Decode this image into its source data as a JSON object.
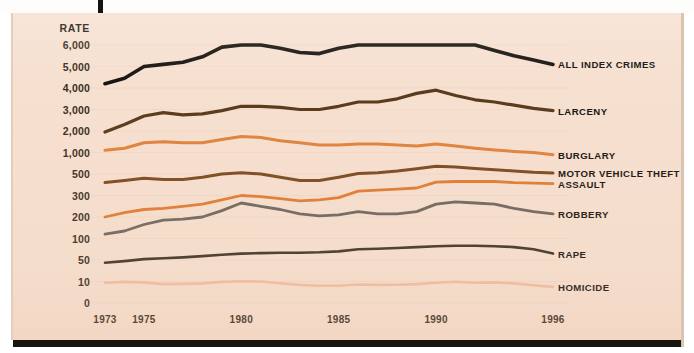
{
  "figure": {
    "background_color": "#f6e0d0",
    "rate_axis_title": "RATE",
    "y_tick_labels": [
      "6,000",
      "5,000",
      "4,000",
      "3,000",
      "2,000",
      "1,000",
      "500",
      "300",
      "200",
      "100",
      "50",
      "10",
      "0"
    ],
    "x_tick_labels": [
      "1973",
      "1975",
      "1980",
      "1985",
      "1990",
      "1996"
    ]
  },
  "chart_data": {
    "type": "line",
    "title": "",
    "subtitle": "",
    "xlabel": "",
    "ylabel": "RATE",
    "grid": true,
    "legend_position": "right-inline",
    "y_scale": "piecewise-log",
    "y_tick_values": [
      6000,
      5000,
      4000,
      3000,
      2000,
      1000,
      500,
      300,
      200,
      100,
      50,
      10,
      0
    ],
    "xlim": [
      1973,
      1996
    ],
    "x": [
      1973,
      1974,
      1975,
      1976,
      1977,
      1978,
      1979,
      1980,
      1981,
      1982,
      1983,
      1984,
      1985,
      1986,
      1987,
      1988,
      1989,
      1990,
      1991,
      1992,
      1993,
      1994,
      1995,
      1996
    ],
    "series": [
      {
        "name": "ALL INDEX CRIMES",
        "color": "#191410",
        "values": [
          4200,
          4450,
          5000,
          5100,
          5200,
          5450,
          5900,
          6250,
          6150,
          5850,
          5650,
          5600,
          5850,
          6050,
          6000,
          6200,
          6350,
          6400,
          6200,
          6000,
          5750,
          5500,
          5300,
          5100
        ]
      },
      {
        "name": "LARCENY",
        "color": "#5a3a1c",
        "values": [
          1950,
          2300,
          2700,
          2850,
          2750,
          2800,
          2950,
          3150,
          3150,
          3100,
          3000,
          3000,
          3150,
          3350,
          3350,
          3500,
          3750,
          3900,
          3650,
          3450,
          3350,
          3200,
          3050,
          2950
        ]
      },
      {
        "name": "BURGLARY",
        "color": "#e0823c",
        "values": [
          1100,
          1200,
          1450,
          1500,
          1450,
          1450,
          1600,
          1750,
          1700,
          1550,
          1450,
          1350,
          1350,
          1400,
          1400,
          1350,
          1300,
          1400,
          1300,
          1200,
          1120,
          1050,
          1000,
          950
        ]
      },
      {
        "name": "MOTOR VEHICLE THEFT",
        "color": "#7a4a1e",
        "values": [
          420,
          440,
          460,
          450,
          450,
          470,
          500,
          530,
          500,
          470,
          440,
          440,
          470,
          510,
          530,
          570,
          620,
          680,
          660,
          630,
          600,
          570,
          540,
          520
        ]
      },
      {
        "name": "ASSAULT",
        "color": "#e07b33",
        "values": [
          200,
          220,
          235,
          240,
          250,
          260,
          280,
          300,
          295,
          285,
          275,
          280,
          290,
          340,
          350,
          360,
          370,
          425,
          430,
          430,
          430,
          420,
          415,
          410
        ]
      },
      {
        "name": "ROBBERY",
        "color": "#6d6660",
        "values": [
          120,
          135,
          165,
          185,
          190,
          200,
          230,
          265,
          250,
          235,
          215,
          205,
          210,
          225,
          215,
          215,
          225,
          260,
          270,
          265,
          260,
          240,
          225,
          215
        ]
      },
      {
        "name": "RAPE",
        "color": "#3d3326",
        "values": [
          45,
          48,
          52,
          54,
          56,
          59,
          62,
          65,
          66,
          67,
          67,
          68,
          70,
          75,
          76,
          78,
          80,
          82,
          83,
          83,
          82,
          80,
          75,
          65
        ]
      },
      {
        "name": "HOMICIDE",
        "color": "#f0bda0",
        "values": [
          9.4,
          9.8,
          9.6,
          8.8,
          8.9,
          9.1,
          9.8,
          10.3,
          10.0,
          9.2,
          8.4,
          8.0,
          8.0,
          8.6,
          8.4,
          8.5,
          8.8,
          9.4,
          9.9,
          9.4,
          9.6,
          9.1,
          8.3,
          7.5
        ]
      }
    ]
  }
}
